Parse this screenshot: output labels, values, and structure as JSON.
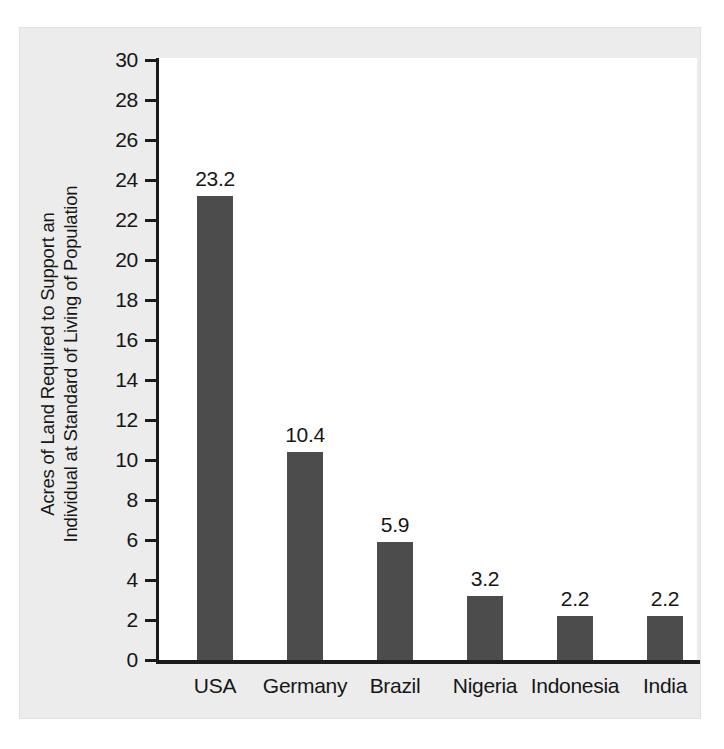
{
  "chart_data": {
    "type": "bar",
    "title": "",
    "xlabel": "",
    "ylabel": "Acres of Land Required to Support an Individual at Standard of Living of Population",
    "ylabel_lines": [
      "Acres of Land Required to Support an",
      "Individual at Standard of Living of Population"
    ],
    "categories": [
      "USA",
      "Germany",
      "Brazil",
      "Nigeria",
      "Indonesia",
      "India"
    ],
    "values": [
      23.2,
      10.4,
      5.9,
      3.2,
      2.2,
      2.2
    ],
    "value_labels": [
      "23.2",
      "10.4",
      "5.9",
      "3.2",
      "2.2",
      "2.2"
    ],
    "ylim": [
      0,
      30
    ],
    "ytick_step": 2,
    "ytick_labels": [
      "30",
      "28",
      "26",
      "24",
      "22",
      "20",
      "18",
      "16",
      "14",
      "12",
      "10",
      "8",
      "6",
      "4",
      "2",
      "0"
    ],
    "ytick_values": [
      30,
      28,
      26,
      24,
      22,
      20,
      18,
      16,
      14,
      12,
      10,
      8,
      6,
      4,
      2,
      0
    ],
    "grid": false,
    "legend": false,
    "bar_color": "#4c4c4c",
    "plot_background": "#ffffff",
    "card_background": "#ececec",
    "axis_color": "#1b1b1b"
  }
}
